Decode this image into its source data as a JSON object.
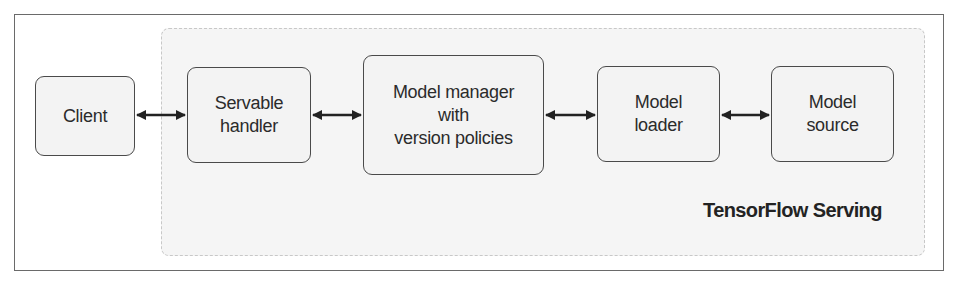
{
  "diagram": {
    "title": "TensorFlow Serving",
    "nodes": [
      {
        "id": "client",
        "label_lines": [
          "Client"
        ]
      },
      {
        "id": "servable_handler",
        "label_lines": [
          "Servable",
          "handler"
        ]
      },
      {
        "id": "model_manager",
        "label_lines": [
          "Model manager",
          "with",
          "version policies"
        ]
      },
      {
        "id": "model_loader",
        "label_lines": [
          "Model",
          "loader"
        ]
      },
      {
        "id": "model_source",
        "label_lines": [
          "Model",
          "source"
        ]
      }
    ],
    "edges": [
      {
        "from": "client",
        "to": "servable_handler",
        "type": "bidirectional"
      },
      {
        "from": "servable_handler",
        "to": "model_manager",
        "type": "bidirectional"
      },
      {
        "from": "model_manager",
        "to": "model_loader",
        "type": "bidirectional"
      },
      {
        "from": "model_loader",
        "to": "model_source",
        "type": "bidirectional"
      }
    ],
    "group": {
      "label": "TensorFlow Serving",
      "contains": [
        "servable_handler",
        "model_manager",
        "model_loader",
        "model_source"
      ]
    }
  },
  "colors": {
    "frame_border": "#6a6a6a",
    "group_fill": "#f5f5f5",
    "box_border": "#4a4a4a",
    "box_fill": "#f3f3f3",
    "arrow": "#222222",
    "text": "#2b2b2b"
  }
}
